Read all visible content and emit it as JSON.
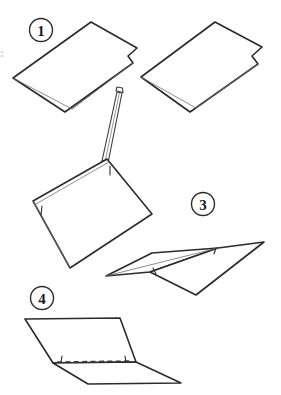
{
  "diagram": {
    "style": "black and white line drawing",
    "background_color": "#ffffff",
    "ink_color": "#2b2b2b",
    "secondary_ink_color": "#8d8d8d",
    "steps": [
      {
        "number": "1",
        "marker_label": "1",
        "description": "Two folded sheets of paper shown lying flat, each creased once along the long edge",
        "marker_x": 41,
        "marker_y": 30
      },
      {
        "number": "2",
        "marker_label": "",
        "description": "Folded sheet with a pencil marking a line along the crease",
        "marker_x": 0,
        "marker_y": 0
      },
      {
        "number": "3",
        "marker_label": "3",
        "description": "Paper tented open showing the ridge fold with arrow tick marks",
        "marker_x": 203,
        "marker_y": 204
      },
      {
        "number": "4",
        "marker_label": "4",
        "description": "Paper opened showing dashed crease line across the middle",
        "marker_x": 42,
        "marker_y": 298
      }
    ],
    "annotations": {
      "pencil": "pencil-drawing-tool",
      "dashed_line": "fold-crease-guide",
      "tick_marks": "fold-alignment-marks"
    }
  }
}
